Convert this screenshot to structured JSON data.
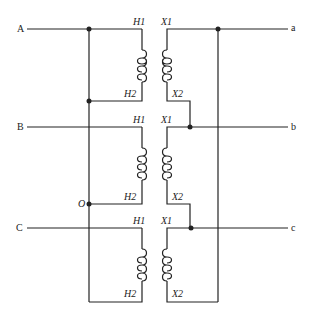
{
  "diagram": {
    "type": "three-phase transformer bank connection",
    "primary_terminals": [
      "A",
      "B",
      "C"
    ],
    "secondary_terminals": [
      "a",
      "b",
      "c"
    ],
    "neutral_label": "O",
    "transformers": [
      {
        "primary_top": "H1",
        "primary_bottom": "H2",
        "secondary_top": "X1",
        "secondary_bottom": "X2"
      },
      {
        "primary_top": "H1",
        "primary_bottom": "H2",
        "secondary_top": "X1",
        "secondary_bottom": "X2"
      },
      {
        "primary_top": "H1",
        "primary_bottom": "H2",
        "secondary_top": "X1",
        "secondary_bottom": "X2"
      }
    ],
    "line_color": "#222222"
  }
}
